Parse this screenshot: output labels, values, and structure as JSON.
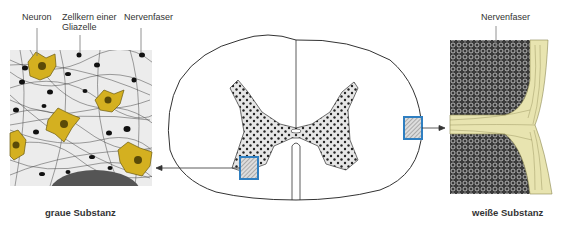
{
  "figure": {
    "labels": {
      "neuron": "Neuron",
      "glia_nucleus_line1": "Zellkern einer",
      "glia_nucleus_line2": "Gliazelle",
      "nerve_fiber_left": "Nervenfaser",
      "nerve_fiber_right": "Nervenfaser"
    },
    "captions": {
      "grey_matter": "graue Substanz",
      "white_matter": "weiße Substanz"
    },
    "colors": {
      "neuron_fill": "#d4b020",
      "neuron_dark": "#5a4a08",
      "highlight_box": "#2f7fc1",
      "fiber_sheath": "#e8e4b0",
      "outline": "#333333",
      "grey_matter_fill": "#e6e6e6"
    }
  }
}
